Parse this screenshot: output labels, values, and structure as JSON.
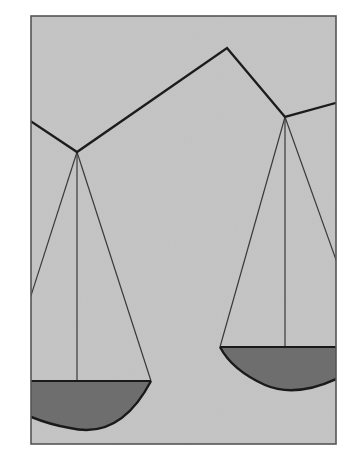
{
  "illustration": {
    "subject": "balance scale (scales of justice), tilted",
    "colors": {
      "page_background": "#ffffff",
      "frame_fill": "#c4c4c4",
      "frame_border": "#555555",
      "beam": "#1c1c1c",
      "strings": "#3a3a3a",
      "pan_fill": "#6e6e6e",
      "pan_rim": "#1a1a1a"
    },
    "frame": {
      "x": 31,
      "y": 16,
      "width": 305,
      "height": 428
    },
    "beam_points": [
      [
        31,
        121
      ],
      [
        77,
        152
      ],
      [
        227,
        48
      ],
      [
        285,
        117
      ],
      [
        336,
        103
      ]
    ],
    "left_pan": {
      "pivot": [
        77,
        152
      ],
      "rim_y": 381,
      "rim_x_range": [
        31,
        151
      ],
      "bottom_y": 428
    },
    "right_pan": {
      "pivot": [
        285,
        117
      ],
      "rim_y": 347,
      "rim_x_range": [
        220,
        336
      ],
      "bottom_y": 392
    }
  }
}
